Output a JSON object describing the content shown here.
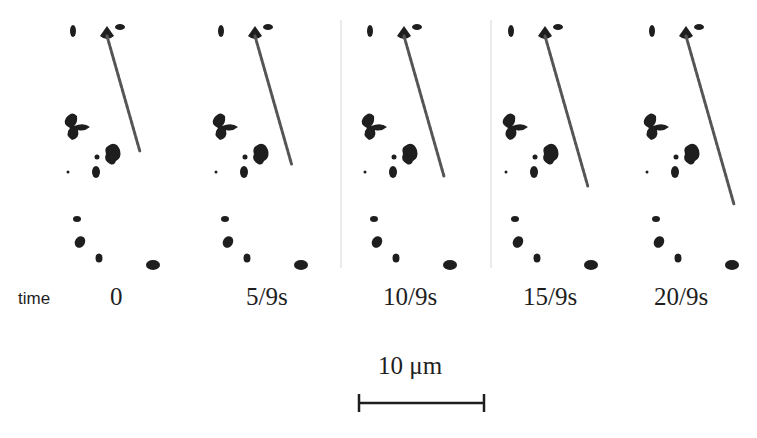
{
  "figure": {
    "time_axis_label": "time",
    "frames": [
      {
        "time_label": "0",
        "filament_length_fraction": 0.58
      },
      {
        "time_label": "5/9s",
        "filament_length_fraction": 0.64
      },
      {
        "time_label": "10/9s",
        "filament_length_fraction": 0.7
      },
      {
        "time_label": "15/9s",
        "filament_length_fraction": 0.75
      },
      {
        "time_label": "20/9s",
        "filament_length_fraction": 0.84
      }
    ],
    "scale_bar": {
      "label": "10 μm",
      "length_um": 10
    },
    "colors": {
      "ink": "#1e1e1e",
      "filament": "#555555",
      "background": "#ffffff"
    }
  }
}
